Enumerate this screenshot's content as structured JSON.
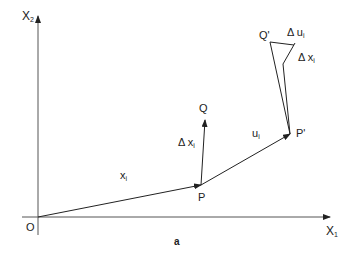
{
  "diagram": {
    "caption": "a",
    "axes": {
      "x_axis": {
        "label": "X",
        "subscript": "1"
      },
      "y_axis": {
        "label": "X",
        "subscript": "2"
      },
      "origin": "O"
    },
    "points": {
      "P": "P",
      "Q": "Q",
      "P_prime": "P'",
      "Q_prime": "Q'"
    },
    "vectors": {
      "x_i": {
        "label": "x",
        "subscript": "i"
      },
      "u_i": {
        "label": "u",
        "subscript": "i"
      },
      "delta_x_i": {
        "label": "Δ x",
        "subscript": "i"
      },
      "delta_x_i_prime": {
        "label": "Δ x",
        "subscript": "i"
      },
      "delta_u_i": {
        "label": "Δ u",
        "subscript": "i"
      }
    }
  }
}
